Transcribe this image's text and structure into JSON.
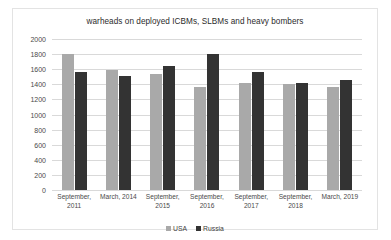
{
  "chart_data": {
    "type": "bar",
    "title": "warheads on deployed ICBMs, SLBMs and heavy bombers",
    "xlabel": "",
    "ylabel": "",
    "ylim": [
      0,
      2000
    ],
    "yticks": [
      2000,
      1800,
      1600,
      1400,
      1200,
      1000,
      800,
      600,
      400,
      200,
      0
    ],
    "grid": true,
    "legend_position": "bottom",
    "categories": [
      "September, 2011",
      "March, 2014",
      "September, 2015",
      "September, 2016",
      "September, 2017",
      "September, 2018",
      "March, 2019"
    ],
    "category_lines": [
      [
        "September,",
        "2011"
      ],
      [
        "March, 2014",
        ""
      ],
      [
        "September,",
        "2015"
      ],
      [
        "September,",
        "2016"
      ],
      [
        "September,",
        "2017"
      ],
      [
        "September,",
        "2018"
      ],
      [
        "March, 2019",
        ""
      ]
    ],
    "series": [
      {
        "name": "USA",
        "color": "#a9a9a9",
        "values": [
          1800,
          1585,
          1538,
          1367,
          1411,
          1398,
          1365
        ]
      },
      {
        "name": "Russia",
        "color": "#333333",
        "values": [
          1566,
          1512,
          1648,
          1796,
          1561,
          1420,
          1461
        ]
      }
    ]
  }
}
